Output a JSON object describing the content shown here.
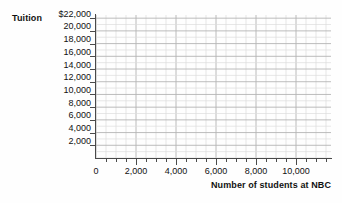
{
  "chart_data": {
    "type": "scatter",
    "title": "",
    "subtitle": "",
    "xlabel": "Number of students at NBC",
    "ylabel": "Tuition",
    "x": [],
    "values": [],
    "series": [],
    "annotations": [],
    "grid": true,
    "legend": false,
    "legend_position": "none",
    "xlim": [
      0,
      11750
    ],
    "ylim": [
      0,
      22500
    ],
    "x_tick_labels": [
      "0",
      "2,000",
      "4,000",
      "6,000",
      "8,000",
      "10,000"
    ],
    "x_tick_values": [
      0,
      2000,
      4000,
      6000,
      8000,
      10000
    ],
    "x_minor_tick_step": 500,
    "y_tick_labels": [
      "$22,000",
      "20,000",
      "18,000",
      "16,000",
      "14,000",
      "12,000",
      "10,000",
      "8,000",
      "6,000",
      "4,000",
      "2,000"
    ],
    "y_tick_values": [
      22000,
      20000,
      18000,
      16000,
      14000,
      12000,
      10000,
      8000,
      6000,
      4000,
      2000
    ],
    "grid_minor_step_x": 500,
    "grid_minor_step_y": 1000,
    "colors": {
      "background": "#fefefe",
      "axis": "#4a4a4a",
      "grid_minor": "#dcdcdc",
      "grid_major": "#b4b4b4",
      "text": "#111111"
    }
  },
  "axes": {
    "y_title": "Tuition",
    "x_title": "Number of students at NBC"
  }
}
